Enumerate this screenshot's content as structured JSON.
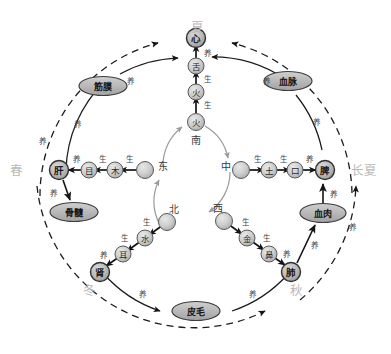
{
  "diagram": {
    "type": "five-element-cycle-diagram",
    "colors": {
      "node_fill": "#c9c9c9",
      "node_stroke": "#5a5a5a",
      "oval_fill": "#b4b4b4",
      "oval_stroke": "#3d3d3d",
      "solid_arc": "#1c1c1c",
      "dashed_arc": "#1c1c1c",
      "inner_arc": "#9a9a9a",
      "season_text": "#b9b9b9",
      "label_text": "#2b2b2b"
    },
    "seasons": [
      {
        "id": "season-summer",
        "label": "夏",
        "position": "top"
      },
      {
        "id": "season-spring",
        "label": "春",
        "position": "left"
      },
      {
        "id": "season-late-summer",
        "label": "长夏",
        "position": "right"
      },
      {
        "id": "season-winter",
        "label": "冬",
        "position": "bottom-left"
      },
      {
        "id": "season-autumn",
        "label": "秋",
        "position": "bottom-right"
      }
    ],
    "directions": [
      {
        "id": "direction-south",
        "label": "南"
      },
      {
        "id": "direction-east",
        "label": "东"
      },
      {
        "id": "direction-center",
        "label": "中"
      },
      {
        "id": "direction-west",
        "label": "西"
      },
      {
        "id": "direction-north",
        "label": "北"
      }
    ],
    "elements": [
      {
        "id": "element-fire",
        "label": "火"
      },
      {
        "id": "element-wood",
        "label": "木"
      },
      {
        "id": "element-earth",
        "label": "土"
      },
      {
        "id": "element-metal",
        "label": "金"
      },
      {
        "id": "element-water",
        "label": "水"
      }
    ],
    "sense_organs": [
      {
        "id": "sense-tongue",
        "label": "舌"
      },
      {
        "id": "sense-eye",
        "label": "目"
      },
      {
        "id": "sense-mouth",
        "label": "口"
      },
      {
        "id": "sense-nose",
        "label": "鼻"
      },
      {
        "id": "sense-ear",
        "label": "耳"
      }
    ],
    "organs": [
      {
        "id": "organ-heart",
        "label": "心"
      },
      {
        "id": "organ-liver",
        "label": "肝"
      },
      {
        "id": "organ-spleen",
        "label": "脾"
      },
      {
        "id": "organ-lung",
        "label": "肺"
      },
      {
        "id": "organ-kidney",
        "label": "肾"
      }
    ],
    "tissues": [
      {
        "id": "tissue-vessels",
        "label": "血脉"
      },
      {
        "id": "tissue-fascia",
        "label": "筋膜"
      },
      {
        "id": "tissue-flesh",
        "label": "血肉"
      },
      {
        "id": "tissue-skin",
        "label": "皮毛"
      },
      {
        "id": "tissue-marrow",
        "label": "骨髓"
      }
    ],
    "relations": {
      "generate": "生",
      "nourish": "养"
    },
    "edge_labels": {
      "fire_chain_1": "生",
      "fire_chain_2": "生",
      "fire_chain_3": "养",
      "wood_chain_1": "生",
      "wood_chain_2": "生",
      "wood_chain_3": "养",
      "earth_chain_1": "生",
      "earth_chain_2": "生",
      "earth_chain_3": "养",
      "metal_chain_1": "生",
      "metal_chain_2": "生",
      "metal_chain_3": "养",
      "water_chain_1": "生",
      "water_chain_2": "生",
      "water_chain_3": "养",
      "liver_to_marrow": "养",
      "spleen_to_flesh": "养",
      "lung_to_flesh": "养",
      "kidney_to_skin": "养",
      "skin_to_lung": "养",
      "heart_to_vessels_outer": "养",
      "fascia_to_heart": "养",
      "outer_left": "养",
      "outer_right": "养",
      "outer_bottom_left": "养",
      "outer_bottom_right": "养"
    }
  }
}
